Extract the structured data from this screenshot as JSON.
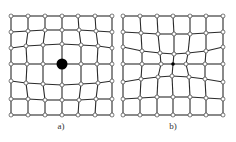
{
  "figure": {
    "panels": [
      {
        "label": "a)",
        "label_pos": [
          61,
          121
        ],
        "center": {
          "x": 62,
          "y": 64,
          "r": 5.5,
          "style": "large-black-dot"
        },
        "nodes": [
          [
            [
              11,
              16
            ],
            [
              28,
              16
            ],
            [
              45,
              16
            ],
            [
              62,
              16
            ],
            [
              78,
              16
            ],
            [
              95,
              16
            ],
            [
              112,
              16
            ]
          ],
          [
            [
              11,
              32
            ],
            [
              28,
              31
            ],
            [
              45,
              30
            ],
            [
              62,
              30
            ],
            [
              79,
              30
            ],
            [
              96,
              31
            ],
            [
              112,
              32
            ]
          ],
          [
            [
              11,
              48
            ],
            [
              26,
              46
            ],
            [
              43,
              45
            ],
            [
              62,
              44
            ],
            [
              81,
              45
            ],
            [
              98,
              46
            ],
            [
              112,
              48
            ]
          ],
          [
            [
              11,
              64
            ],
            [
              27,
              64
            ],
            [
              43,
              64
            ],
            [
              62,
              64
            ],
            [
              81,
              64
            ],
            [
              97,
              64
            ],
            [
              112,
              64
            ]
          ],
          [
            [
              11,
              81
            ],
            [
              26,
              83
            ],
            [
              43,
              84
            ],
            [
              62,
              85
            ],
            [
              81,
              84
            ],
            [
              98,
              83
            ],
            [
              112,
              81
            ]
          ],
          [
            [
              11,
              99
            ],
            [
              28,
              99
            ],
            [
              45,
              100
            ],
            [
              62,
              100
            ],
            [
              79,
              100
            ],
            [
              96,
              99
            ],
            [
              112,
              99
            ]
          ],
          [
            [
              11,
              115
            ],
            [
              28,
              115
            ],
            [
              45,
              115
            ],
            [
              62,
              115
            ],
            [
              78,
              115
            ],
            [
              95,
              115
            ],
            [
              112,
              115
            ]
          ]
        ]
      },
      {
        "label": "b)",
        "label_pos": [
          173,
          121
        ],
        "center": {
          "x": 173,
          "y": 64,
          "r": 1.8,
          "style": "small-black-dot"
        },
        "nodes": [
          [
            [
              123,
              16
            ],
            [
              140,
              16
            ],
            [
              157,
              16
            ],
            [
              173,
              16
            ],
            [
              190,
              16
            ],
            [
              206,
              16
            ],
            [
              223,
              16
            ]
          ],
          [
            [
              123,
              32
            ],
            [
              141,
              33
            ],
            [
              158,
              34
            ],
            [
              174,
              34
            ],
            [
              190,
              34
            ],
            [
              206,
              33
            ],
            [
              223,
              32
            ]
          ],
          [
            [
              123,
              47
            ],
            [
              142,
              51
            ],
            [
              160,
              53
            ],
            [
              174,
              54
            ],
            [
              188,
              53
            ],
            [
              206,
              51
            ],
            [
              223,
              47
            ]
          ],
          [
            [
              123,
              64
            ],
            [
              142,
              64
            ],
            [
              161,
              64
            ],
            [
              173,
              64
            ],
            [
              186,
              64
            ],
            [
              205,
              64
            ],
            [
              223,
              64
            ]
          ],
          [
            [
              123,
              82
            ],
            [
              141,
              79
            ],
            [
              158,
              77
            ],
            [
              172,
              76
            ],
            [
              189,
              77
            ],
            [
              205,
              79
            ],
            [
              223,
              82
            ]
          ],
          [
            [
              123,
              99
            ],
            [
              140,
              98
            ],
            [
              157,
              97
            ],
            [
              173,
              97
            ],
            [
              190,
              97
            ],
            [
              206,
              98
            ],
            [
              223,
              99
            ]
          ],
          [
            [
              123,
              115
            ],
            [
              140,
              115
            ],
            [
              157,
              115
            ],
            [
              173,
              115
            ],
            [
              190,
              115
            ],
            [
              206,
              115
            ],
            [
              223,
              115
            ]
          ]
        ]
      }
    ],
    "colors": {
      "line": "#2a2a2a",
      "node_fill": "#ffffff",
      "node_stroke": "#444444",
      "center": "#000000"
    }
  }
}
